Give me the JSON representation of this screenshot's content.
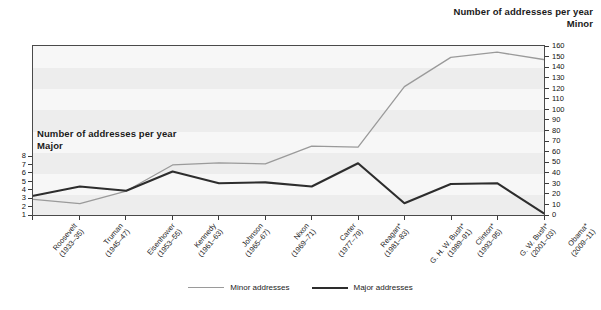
{
  "header": {
    "title_line1": "Number of addresses per year",
    "title_line2": "Minor"
  },
  "inner_label": {
    "line1": "Number of addresses per year",
    "line2": "Major"
  },
  "legend": {
    "minor_label": "Minor addresses",
    "major_label": "Major addresses",
    "minor_color": "#9a9a9a",
    "major_color": "#2d2d2d"
  },
  "chart_data": {
    "type": "line",
    "title": "Number of addresses per year",
    "xlabel": "",
    "ylabel": "Major",
    "y2label": "Minor",
    "grid": false,
    "legend_position": "bottom",
    "categories": [
      "Roosevelt\n(1933–35)",
      "Truman\n(1945–47)",
      "Eisenhower\n(1953–55)",
      "Kennedy\n(1961–63)",
      "Johnson\n(1965–67)",
      "Nixon\n(1969–71)",
      "Carter\n(1977–79)",
      "Reagan*\n(1981–83)",
      "G. H. W. Bush*\n(1989–91)",
      "Clinton*\n(1993–95)",
      "G. W. Bush*\n(2001–03)",
      "Obama*\n(2009–11)"
    ],
    "category_names": [
      "Roosevelt",
      "Truman",
      "Eisenhower",
      "Kennedy",
      "Johnson",
      "Nixon",
      "Carter",
      "Reagan*",
      "G. H. W. Bush*",
      "Clinton*",
      "G. W. Bush*",
      "Obama*"
    ],
    "category_years": [
      "(1933–35)",
      "(1945–47)",
      "(1953–55)",
      "(1961–63)",
      "(1965–67)",
      "(1969–71)",
      "(1977–79)",
      "(1981–83)",
      "(1989–91)",
      "(1993–95)",
      "(2001–03)",
      "(2009–11)"
    ],
    "series": [
      {
        "name": "Minor addresses",
        "axis": "right",
        "color": "#9a9a9a",
        "values": [
          14,
          10,
          22,
          47,
          49,
          48,
          65,
          64,
          122,
          150,
          155,
          148
        ]
      },
      {
        "name": "Major addresses",
        "axis": "left",
        "color": "#2d2d2d",
        "values": [
          3.2,
          4.3,
          3.8,
          6.1,
          4.7,
          4.8,
          4.3,
          7.1,
          2.3,
          4.6,
          4.7,
          1.1
        ]
      }
    ],
    "ylim": [
      1,
      8
    ],
    "yticks": [
      1,
      2,
      3,
      4,
      5,
      6,
      7,
      8
    ],
    "y2lim": [
      0,
      160
    ],
    "y2ticks": [
      0,
      10,
      20,
      30,
      40,
      50,
      60,
      70,
      80,
      90,
      100,
      110,
      120,
      130,
      140,
      150,
      160
    ]
  }
}
